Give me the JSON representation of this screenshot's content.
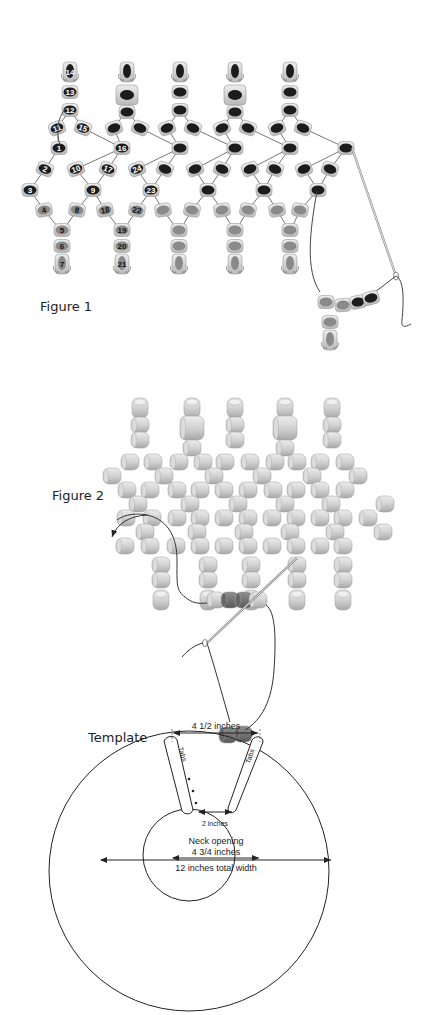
{
  "figure1": {
    "caption": "Figure 1",
    "colors": {
      "dark_bead_core": "#1c1c1c",
      "light_bead_core": "#8a8a8a",
      "bead_shell": "#cfcfcf",
      "thread": "#555555"
    },
    "numbered_beads": [
      "1",
      "2",
      "3",
      "4",
      "5",
      "6",
      "7",
      "8",
      "9",
      "10",
      "11",
      "12",
      "13",
      "14",
      "15",
      "16",
      "17",
      "18",
      "19",
      "20",
      "21",
      "22",
      "23",
      "24"
    ]
  },
  "figure2": {
    "caption": "Figure 2",
    "colors": {
      "bead": "#d6d6d6",
      "accent_bead": "#7a7a7a",
      "thread": "#333333"
    }
  },
  "template": {
    "caption": "Template",
    "top_width_label": "4 1/2 inches",
    "tab_left_label": "Tabs",
    "tab_right_label": "Tabs",
    "tab_gap_label": "2 inches",
    "neck_label_line1": "Neck opening",
    "neck_label_line2": "4 3/4 inches",
    "total_width_label": "12 inches total width"
  }
}
